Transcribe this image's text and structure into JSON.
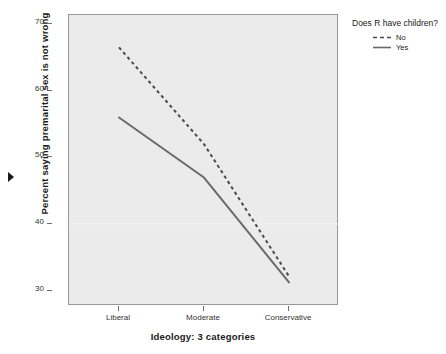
{
  "chart_data": {
    "type": "line",
    "title": "",
    "xlabel": "Ideology: 3 categories",
    "ylabel": "Percent saying premarital sex is not wrong",
    "categories": [
      "Liberal",
      "Moderate",
      "Conservative"
    ],
    "ylim": [
      28,
      71.5
    ],
    "yticks": [
      30,
      40,
      50,
      60,
      70
    ],
    "ytick_labels": [
      "30",
      "40",
      "50",
      "60",
      "70"
    ],
    "grid": false,
    "legend_position": "right",
    "legend_title": "Does R have children?",
    "series": [
      {
        "name": "No",
        "style": "dashed",
        "color": "#4a4a4a",
        "values": [
          66.5,
          52.0,
          32.2
        ]
      },
      {
        "name": "Yes",
        "style": "solid",
        "color": "#6a6a6a",
        "values": [
          56.0,
          47.0,
          31.3
        ]
      }
    ]
  },
  "axes": {
    "y_title": "Percent saying premarital sex is not wrong",
    "x_title": "Ideology: 3 categories",
    "y_tick_labels": [
      "70",
      "60",
      "50",
      "40",
      "30"
    ],
    "x_tick_labels": [
      "Liberal",
      "Moderate",
      "Conservative"
    ]
  },
  "legend": {
    "title": "Does R have children?",
    "items": [
      {
        "label": "No",
        "style": "dashed"
      },
      {
        "label": "Yes",
        "style": "solid"
      }
    ]
  },
  "colors": {
    "plot_background": "#ebebeb",
    "page_background": "#ffffff",
    "frame_border": "#9a9a9a",
    "series_no": "#4a4a4a",
    "series_yes": "#6a6a6a",
    "text": "#1a1a1a"
  },
  "marker": {
    "name": "row-selection-marker"
  }
}
